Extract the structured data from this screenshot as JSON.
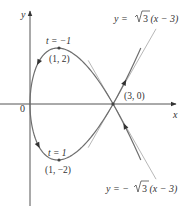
{
  "figure": {
    "width": 190,
    "height": 212,
    "colors": {
      "axis": "#555555",
      "curve": "#6e6e6e",
      "tangent": "#b8b8b8",
      "text": "#333333",
      "point": "#444444"
    },
    "axes": {
      "origin_px": [
        30,
        104
      ],
      "x_px_per_unit": 27.7,
      "y_px_per_unit": 28,
      "x_axis": {
        "from_px": 0,
        "to_px": 176,
        "label": "x"
      },
      "y_axis": {
        "from_px": 206,
        "to_px": 11,
        "label": "y"
      },
      "origin_label": "0"
    },
    "curve": {
      "parametric": "x = t^2, y = t^3 - 3t",
      "t_min": -2,
      "t_max": 2,
      "direction": "increasing t"
    },
    "tangents": [
      {
        "label": "y = √3(x − 3)",
        "prefix": "y = ",
        "sqrt": "3",
        "suffix": "(x − 3)",
        "slope": 1.732,
        "x_from": 2.1,
        "x_to": 4.55
      },
      {
        "label": "y = −√3(x − 3)",
        "prefix": "y = −",
        "sqrt": "3",
        "suffix": "(x − 3)",
        "slope": -1.732,
        "x_from": 2.1,
        "x_to": 4.55
      }
    ],
    "points": [
      {
        "coord_label": "(1, 2)",
        "param_label": "t = −1",
        "x": 1,
        "y": 2
      },
      {
        "coord_label": "(1, −2)",
        "param_label": "t = 1",
        "x": 1,
        "y": -2
      },
      {
        "coord_label": "(3, 0)",
        "x": 3,
        "y": 0
      }
    ],
    "arrows_at_t": [
      -1.85,
      -0.55,
      0.55,
      1.85
    ]
  }
}
